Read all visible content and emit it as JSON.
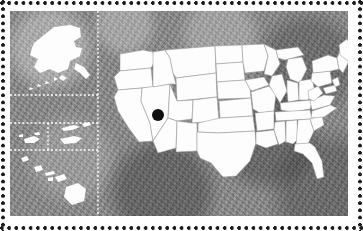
{
  "figure": {
    "kind": "locator-map",
    "border_style": "perforated-stamp-dots",
    "border_dot_color": "#1c1c1c"
  },
  "map": {
    "background_color": "#8b8b8b",
    "background_description": "mottled grayscale satellite imagery",
    "land_fill": "#fdfdfd",
    "state_border_color": "#9a9a9a",
    "divider_color": "#ffffff",
    "divider_style": "dotted",
    "panels": [
      {
        "name": "contiguous-united-states",
        "label": "Contiguous United States"
      },
      {
        "name": "alaska-inset",
        "label": "Alaska"
      },
      {
        "name": "pacific-territories-inset-west",
        "label": "Guam and Northern Mariana Islands"
      },
      {
        "name": "pacific-territories-inset-east",
        "label": "American Samoa"
      },
      {
        "name": "hawaii-inset",
        "label": "Hawaii"
      }
    ]
  },
  "marker": {
    "name": "location-marker",
    "shape": "filled-circle",
    "color": "#101010",
    "radius_px": 6,
    "x_px": 158,
    "y_px": 115,
    "region": "Utah"
  },
  "chart_data": {
    "type": "map",
    "projection": "albers-usa",
    "markers": [
      {
        "label": "Utah",
        "x": 158,
        "y": 115,
        "value": 1,
        "color": "#101010"
      }
    ],
    "legend": [],
    "annotations": []
  }
}
